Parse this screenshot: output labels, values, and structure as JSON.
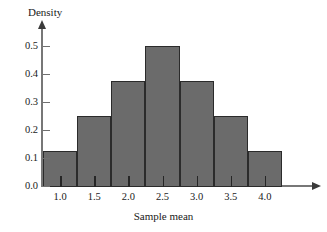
{
  "chart_data": {
    "type": "bar",
    "title": "",
    "subtitle": "",
    "xlabel": "Sample mean",
    "ylabel": "Density",
    "bin_edges": [
      0.75,
      1.25,
      1.75,
      2.25,
      2.75,
      3.25,
      3.75,
      4.25
    ],
    "bin_centers": [
      1.0,
      1.5,
      2.0,
      2.5,
      3.0,
      3.5,
      4.0
    ],
    "categories": [
      "1.0",
      "1.5",
      "2.0",
      "2.5",
      "3.0",
      "3.5",
      "4.0"
    ],
    "values": [
      0.125,
      0.25,
      0.375,
      0.5,
      0.375,
      0.25,
      0.125
    ],
    "bar_width": 0.5,
    "xlim": [
      0.75,
      4.25
    ],
    "ylim": [
      0.0,
      0.5
    ],
    "xticks": [
      "1.0",
      "1.5",
      "2.0",
      "2.5",
      "3.0",
      "3.5",
      "4.0"
    ],
    "yticks": [
      "0.0",
      "0.1",
      "0.2",
      "0.3",
      "0.4",
      "0.5"
    ],
    "ytick_values": [
      0.0,
      0.1,
      0.2,
      0.3,
      0.4,
      0.5
    ],
    "grid": false,
    "legend": null,
    "annotations": [],
    "bar_color": "#6b6b6b",
    "bar_edge_color": "#2b2b2b",
    "axis_color": "#777777",
    "background": "#ffffff"
  },
  "axes": {
    "y_title": "Density",
    "x_title": "Sample mean"
  }
}
